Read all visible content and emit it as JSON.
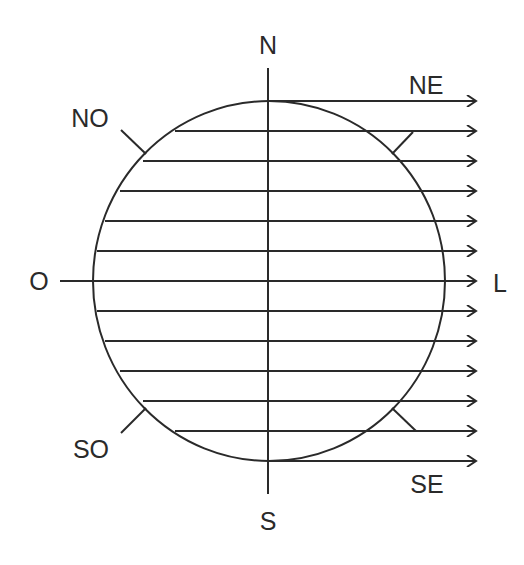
{
  "diagram": {
    "title": "",
    "colors": {
      "stroke": "#2a2a2a",
      "background": "#ffffff"
    },
    "labels": {
      "north": "N",
      "northeast": "NE",
      "northwest": "NO",
      "west": "O",
      "east": "L",
      "southwest": "SO",
      "southeast": "SE",
      "south": "S"
    },
    "circle": {
      "cx": 269,
      "cy": 281,
      "rx": 176,
      "ry": 180
    },
    "parallel_rays": {
      "count": 13,
      "y_start": 101,
      "spacing": 30,
      "arrow_end_x": 476,
      "direction": "east"
    }
  }
}
